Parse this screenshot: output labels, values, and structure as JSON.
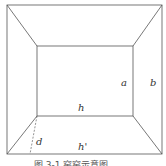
{
  "diagram": {
    "labels": {
      "a": "a",
      "b": "b",
      "h": "h",
      "h_prime": "h'",
      "d": "d"
    },
    "caption": "图 3-1  窑窑示意图",
    "colors": {
      "line": "#555555",
      "label": "#333333"
    }
  }
}
